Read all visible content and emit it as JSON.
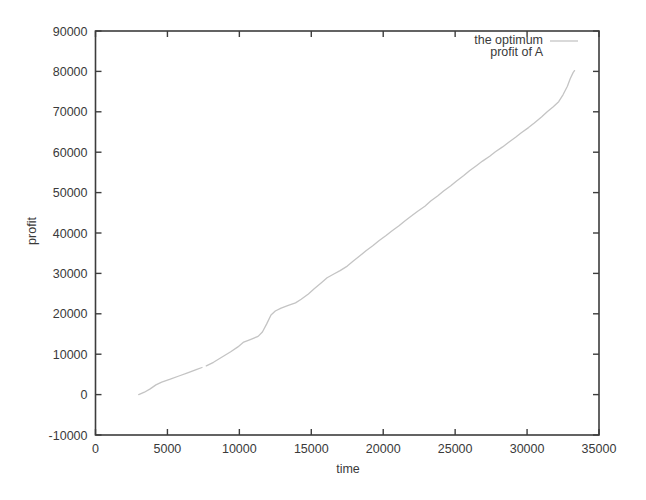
{
  "figure": {
    "background": "#ffffff",
    "border_color": "#3d3d3d",
    "text_color": "#3a3a3a",
    "curve_color": "#c4c4c4"
  },
  "axis": {
    "x_title": "time",
    "y_title": "profit"
  },
  "legend": {
    "line1": "the optimum",
    "line2": "profit of A"
  },
  "chart_data": {
    "type": "line",
    "title": "",
    "xlabel": "time",
    "ylabel": "profit",
    "xlim": [
      0,
      35000
    ],
    "ylim": [
      -10000,
      90000
    ],
    "xticks": [
      0,
      5000,
      10000,
      15000,
      20000,
      25000,
      30000,
      35000
    ],
    "yticks": [
      -10000,
      0,
      10000,
      20000,
      30000,
      40000,
      50000,
      60000,
      70000,
      80000,
      90000
    ],
    "grid": false,
    "legend_position": "top-right-inside",
    "series": [
      {
        "name": "the optimum profit of A",
        "color": "#c4c4c4",
        "segments": [
          [
            [
              3000,
              0
            ],
            [
              3400,
              600
            ],
            [
              3800,
              1400
            ],
            [
              4200,
              2400
            ],
            [
              4600,
              3100
            ],
            [
              5200,
              3800
            ],
            [
              5800,
              4600
            ],
            [
              6400,
              5400
            ],
            [
              7000,
              6200
            ],
            [
              7400,
              6700
            ]
          ],
          [
            [
              7700,
              7100
            ],
            [
              8200,
              8000
            ],
            [
              8800,
              9300
            ],
            [
              9400,
              10600
            ],
            [
              9900,
              11800
            ],
            [
              10300,
              13000
            ],
            [
              10800,
              13700
            ],
            [
              11300,
              14400
            ],
            [
              11600,
              15500
            ],
            [
              11900,
              17500
            ],
            [
              12200,
              19700
            ],
            [
              12500,
              20700
            ],
            [
              12900,
              21400
            ],
            [
              13400,
              22100
            ],
            [
              13900,
              22700
            ],
            [
              14300,
              23600
            ],
            [
              14800,
              24900
            ],
            [
              15200,
              26200
            ],
            [
              15700,
              27700
            ],
            [
              16100,
              28900
            ],
            [
              16600,
              29900
            ],
            [
              17000,
              30700
            ],
            [
              17500,
              31800
            ],
            [
              17900,
              33000
            ],
            [
              18400,
              34400
            ],
            [
              18800,
              35600
            ],
            [
              19300,
              36900
            ],
            [
              19700,
              38100
            ],
            [
              20200,
              39400
            ],
            [
              20600,
              40500
            ],
            [
              21100,
              41800
            ],
            [
              21500,
              43000
            ],
            [
              22000,
              44300
            ],
            [
              22400,
              45400
            ],
            [
              22900,
              46600
            ],
            [
              23300,
              47900
            ],
            [
              23800,
              49200
            ],
            [
              24200,
              50400
            ],
            [
              24700,
              51700
            ],
            [
              25100,
              52900
            ],
            [
              25600,
              54200
            ],
            [
              26000,
              55400
            ],
            [
              26500,
              56700
            ],
            [
              26900,
              57800
            ],
            [
              27400,
              59000
            ],
            [
              27800,
              60100
            ],
            [
              28300,
              61300
            ],
            [
              28700,
              62400
            ],
            [
              29200,
              63700
            ],
            [
              29600,
              64800
            ],
            [
              30100,
              66100
            ],
            [
              30500,
              67200
            ],
            [
              31000,
              68700
            ],
            [
              31400,
              70000
            ],
            [
              31800,
              71200
            ],
            [
              32200,
              72500
            ],
            [
              32500,
              74200
            ],
            [
              32800,
              76300
            ],
            [
              33000,
              78200
            ],
            [
              33200,
              79700
            ],
            [
              33300,
              80200
            ]
          ]
        ]
      }
    ]
  }
}
